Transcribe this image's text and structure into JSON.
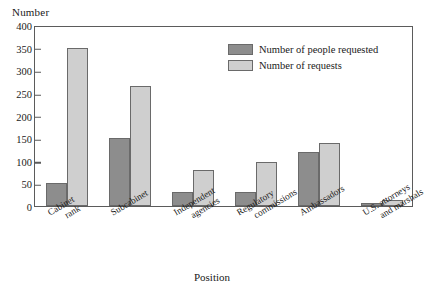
{
  "chart_data": {
    "type": "bar",
    "title": "",
    "xlabel": "Position",
    "ylabel": "Number",
    "ylim": [
      0,
      400
    ],
    "yticks": [
      0,
      50,
      100,
      150,
      200,
      250,
      300,
      350,
      400
    ],
    "grid": false,
    "legend_position": "top-right",
    "categories": [
      "Cabinet rank",
      "Subcabinet",
      "Independent agencies",
      "Regulatory commissions",
      "Ambassadors",
      "U.S. attorneys and marshals"
    ],
    "category_lines": [
      [
        "Cabinet",
        "rank"
      ],
      [
        "Subcabinet",
        ""
      ],
      [
        "Independent",
        "agencies"
      ],
      [
        "Regulatory",
        "commissions"
      ],
      [
        "Ambassadors",
        ""
      ],
      [
        "U.S. attorneys",
        "and marshals"
      ]
    ],
    "series": [
      {
        "name": "Number of people requested",
        "color": "#8d8d8d",
        "values": [
          50,
          150,
          30,
          30,
          120,
          7
        ]
      },
      {
        "name": "Number of requests",
        "color": "#cfcfcf",
        "values": [
          350,
          265,
          80,
          97,
          140,
          13
        ]
      }
    ]
  },
  "axes": {
    "y_title": "Number",
    "x_title": "Position"
  }
}
